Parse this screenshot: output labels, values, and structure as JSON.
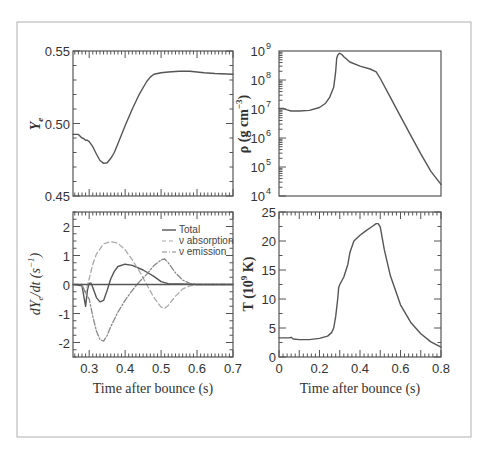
{
  "figure": {
    "border_color": "#b0b0b0",
    "line_color": "#555555",
    "dash_color": "#aaaaaa"
  },
  "chart_data": [
    {
      "id": "ye",
      "type": "line",
      "panel": "top-left",
      "title": "",
      "xlabel": "",
      "ylabel": "Y_e",
      "ylabel_display": "Ye",
      "xlim": [
        0.255,
        0.7
      ],
      "ylim": [
        0.45,
        0.55
      ],
      "yticks": [
        0.45,
        0.5,
        0.55
      ],
      "ytick_labels": [
        "0.45",
        "0.50",
        "0.55"
      ],
      "grid": false,
      "series": [
        {
          "name": "Ye",
          "style": "solid",
          "x": [
            0.255,
            0.27,
            0.28,
            0.285,
            0.29,
            0.295,
            0.3,
            0.31,
            0.32,
            0.33,
            0.34,
            0.35,
            0.36,
            0.37,
            0.38,
            0.4,
            0.42,
            0.44,
            0.46,
            0.47,
            0.48,
            0.5,
            0.52,
            0.55,
            0.58,
            0.6,
            0.62,
            0.65,
            0.7
          ],
          "values": [
            0.4925,
            0.4925,
            0.49,
            0.4895,
            0.4885,
            0.4885,
            0.4875,
            0.484,
            0.479,
            0.4745,
            0.4725,
            0.473,
            0.476,
            0.48,
            0.486,
            0.4985,
            0.51,
            0.5205,
            0.529,
            0.532,
            0.534,
            0.535,
            0.5355,
            0.536,
            0.536,
            0.5355,
            0.535,
            0.5345,
            0.534
          ]
        }
      ]
    },
    {
      "id": "rho",
      "type": "line",
      "panel": "top-right",
      "title": "",
      "xlabel": "",
      "ylabel": "ρ (g cm^-3)",
      "ylabel_display": "ρ (g cm⁻³)",
      "yscale": "log",
      "xlim": [
        0,
        0.8
      ],
      "ylim": [
        10000.0,
        1000000000.0
      ],
      "yticks_exp": [
        4,
        5,
        6,
        7,
        8,
        9
      ],
      "grid": false,
      "series": [
        {
          "name": "density",
          "style": "solid",
          "x": [
            0.0,
            0.02,
            0.04,
            0.06,
            0.1,
            0.15,
            0.2,
            0.23,
            0.25,
            0.27,
            0.28,
            0.285,
            0.29,
            0.295,
            0.3,
            0.31,
            0.32,
            0.35,
            0.4,
            0.45,
            0.48,
            0.5,
            0.55,
            0.6,
            0.65,
            0.7,
            0.75,
            0.8
          ],
          "log10_values": [
            7.02,
            7.02,
            6.97,
            6.93,
            6.93,
            6.95,
            7.05,
            7.2,
            7.4,
            7.75,
            8.3,
            8.75,
            8.85,
            8.9,
            8.92,
            8.88,
            8.8,
            8.62,
            8.48,
            8.38,
            8.28,
            8.05,
            7.4,
            6.75,
            6.1,
            5.45,
            4.85,
            4.4
          ]
        }
      ]
    },
    {
      "id": "dyedt",
      "type": "line",
      "panel": "bottom-left",
      "title": "",
      "xlabel": "Time after bounce (s)",
      "ylabel": "dY_e/dt (s^-1)",
      "ylabel_display": "dYe/dt (s⁻¹)",
      "xlim": [
        0.255,
        0.7
      ],
      "ylim": [
        -2.5,
        2.5
      ],
      "xticks": [
        0.3,
        0.4,
        0.5,
        0.6,
        0.7
      ],
      "xtick_labels": [
        "0.3",
        "0.4",
        "0.5",
        "0.6",
        "0.7"
      ],
      "yticks": [
        -2,
        -1,
        0,
        1,
        2
      ],
      "ytick_labels": [
        "-2",
        "-1",
        "0",
        "1",
        "2"
      ],
      "grid": false,
      "legend": {
        "position": "upper right",
        "entries": [
          "Total",
          "ν absorption",
          "ν emission"
        ]
      },
      "series": [
        {
          "name": "Total",
          "style": "solid",
          "x": [
            0.255,
            0.28,
            0.285,
            0.29,
            0.295,
            0.3,
            0.305,
            0.31,
            0.32,
            0.33,
            0.34,
            0.35,
            0.36,
            0.37,
            0.38,
            0.4,
            0.42,
            0.45,
            0.48,
            0.5,
            0.52,
            0.55,
            0.6,
            0.65,
            0.7
          ],
          "values": [
            0,
            -0.05,
            -0.4,
            -0.75,
            -0.2,
            0.05,
            0.05,
            -0.1,
            -0.45,
            -0.6,
            -0.55,
            -0.2,
            0.2,
            0.45,
            0.62,
            0.7,
            0.66,
            0.5,
            0.28,
            0.1,
            0.03,
            0.02,
            0.0,
            0.0,
            0.0
          ]
        },
        {
          "name": "ν absorption",
          "style": "dashed",
          "x": [
            0.255,
            0.28,
            0.29,
            0.3,
            0.31,
            0.32,
            0.34,
            0.36,
            0.38,
            0.4,
            0.42,
            0.44,
            0.46,
            0.48,
            0.5,
            0.51,
            0.52,
            0.54,
            0.56,
            0.58,
            0.6,
            0.62,
            0.65,
            0.7
          ],
          "values": [
            0,
            0,
            -0.3,
            0.2,
            0.7,
            1.05,
            1.4,
            1.48,
            1.42,
            1.2,
            0.85,
            0.45,
            0.0,
            -0.45,
            -0.78,
            -0.82,
            -0.72,
            -0.4,
            -0.15,
            -0.05,
            0.0,
            0.0,
            0.0,
            0.0
          ]
        },
        {
          "name": "ν emission",
          "style": "dashdot",
          "x": [
            0.255,
            0.28,
            0.29,
            0.3,
            0.31,
            0.32,
            0.33,
            0.34,
            0.35,
            0.36,
            0.38,
            0.4,
            0.42,
            0.44,
            0.46,
            0.48,
            0.5,
            0.51,
            0.52,
            0.54,
            0.56,
            0.58,
            0.6,
            0.62,
            0.65,
            0.7
          ],
          "values": [
            0,
            0,
            -0.3,
            -0.5,
            -1.1,
            -1.6,
            -1.9,
            -1.95,
            -1.75,
            -1.45,
            -0.95,
            -0.55,
            -0.2,
            0.1,
            0.35,
            0.65,
            0.85,
            0.88,
            0.75,
            0.4,
            0.15,
            0.04,
            0.0,
            0.0,
            0.0,
            0.0
          ]
        },
        {
          "name": "zero",
          "style": "solid",
          "x": [
            0.255,
            0.7
          ],
          "values": [
            0,
            0
          ]
        }
      ]
    },
    {
      "id": "temp",
      "type": "line",
      "panel": "bottom-right",
      "title": "",
      "xlabel": "Time after bounce (s)",
      "ylabel": "T (10^9 K)",
      "ylabel_display": "T (10⁹ K)",
      "xlim": [
        0,
        0.8
      ],
      "ylim": [
        0,
        25
      ],
      "xticks": [
        0,
        0.2,
        0.4,
        0.6,
        0.8
      ],
      "xtick_labels": [
        "0",
        "0.2",
        "0.4",
        "0.6",
        "0.8"
      ],
      "yticks": [
        0,
        5,
        10,
        15,
        20,
        25
      ],
      "ytick_labels": [
        "0",
        "5",
        "10",
        "15",
        "20",
        "25"
      ],
      "grid": false,
      "series": [
        {
          "name": "T",
          "style": "solid",
          "x": [
            0.0,
            0.05,
            0.06,
            0.07,
            0.1,
            0.15,
            0.2,
            0.24,
            0.26,
            0.27,
            0.28,
            0.29,
            0.295,
            0.3,
            0.32,
            0.34,
            0.35,
            0.37,
            0.4,
            0.43,
            0.46,
            0.48,
            0.49,
            0.5,
            0.52,
            0.55,
            0.6,
            0.65,
            0.7,
            0.75,
            0.8
          ],
          "values": [
            3.3,
            3.3,
            3.4,
            3.1,
            3.0,
            3.0,
            3.2,
            3.6,
            4.2,
            5.0,
            7.0,
            10.0,
            12.0,
            12.5,
            13.8,
            16.0,
            18.0,
            20.0,
            21.0,
            21.8,
            22.5,
            23.0,
            23.0,
            22.4,
            18.5,
            14.0,
            9.0,
            6.0,
            4.0,
            2.6,
            1.7
          ]
        }
      ]
    }
  ]
}
